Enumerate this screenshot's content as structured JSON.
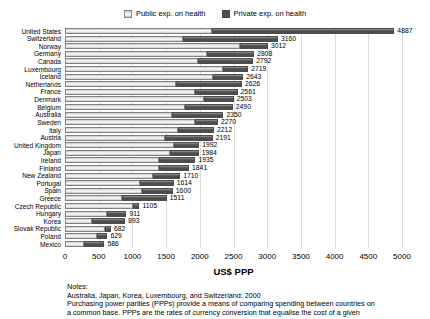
{
  "colors": {
    "public_fill": "#e7e7e7",
    "public_highlight": "#ffffff",
    "public_shade": "#c6c6c6",
    "public_border": "#828282",
    "private_fill": "#4d4d4d",
    "private_top": "#969696",
    "gridline": "#dcdcdc",
    "text": "#000000",
    "background": "#ffffff"
  },
  "legend": {
    "public_label": "Public exp. on health",
    "private_label": "Private exp. on health"
  },
  "chart_data": {
    "type": "bar",
    "orientation": "horizontal",
    "stacked": true,
    "title": "",
    "xlabel": "US$ PPP",
    "ylabel": "",
    "xlim": [
      0,
      5000
    ],
    "xticks": [
      0,
      500,
      1000,
      1500,
      2000,
      2500,
      3000,
      3500,
      4000,
      4500,
      5000
    ],
    "grid": true,
    "legend_position": "top",
    "categories": [
      "United States",
      "Switzerland",
      "Norway",
      "Germany",
      "Canada",
      "Luxembourg",
      "Iceland",
      "Netherlands",
      "France",
      "Denmark",
      "Belgium",
      "Australia",
      "Sweden",
      "Italy",
      "Austria",
      "United Kingdom",
      "Japan",
      "Ireland",
      "Finland",
      "New Zealand",
      "Portugal",
      "Spain",
      "Greece",
      "Czech Republic",
      "Hungary",
      "Korea",
      "Slovak Republic",
      "Poland",
      "Mexico"
    ],
    "series": [
      {
        "name": "Public exp. on health",
        "values": [
          2180,
          1750,
          2590,
          2110,
          1970,
          2350,
          2190,
          1650,
          1930,
          2060,
          1780,
          1590,
          1930,
          1680,
          1480,
          1610,
          1560,
          1400,
          1390,
          1300,
          1120,
          1140,
          845,
          1010,
          620,
          400,
          600,
          480,
          280
        ]
      },
      {
        "name": "Private exp. on health",
        "values": [
          2707,
          1410,
          422,
          698,
          822,
          369,
          453,
          976,
          631,
          443,
          710,
          760,
          340,
          532,
          711,
          382,
          424,
          535,
          451,
          410,
          494,
          460,
          666,
          95,
          291,
          493,
          82,
          149,
          306
        ]
      }
    ],
    "totals": [
      4887,
      3160,
      3012,
      2808,
      2792,
      2719,
      2643,
      2626,
      2561,
      2503,
      2490,
      2350,
      2270,
      2212,
      2191,
      1992,
      1984,
      1935,
      1841,
      1710,
      1614,
      1600,
      1511,
      1105,
      911,
      893,
      682,
      629,
      586
    ],
    "total_labels_shown": true
  },
  "axis": {
    "title": "US$ PPP"
  },
  "notes": {
    "lines": [
      "Notes:",
      "Australia, Japan, Korea, Luxembourg, and Switzerland: 2000",
      "Purchasing power parities (PPPs) provide a means of comparing spending between countries on",
      "a common base. PPPs are the rates of currency conversion that equalise the cost of a given"
    ]
  }
}
